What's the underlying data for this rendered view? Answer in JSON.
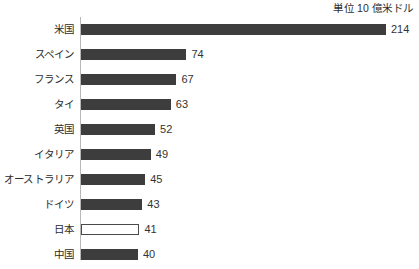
{
  "chart_data": {
    "type": "bar",
    "orientation": "horizontal",
    "title": "",
    "subtitle": "",
    "unit_caption": "単位 10 億米ドル",
    "xlabel": "",
    "ylabel": "",
    "grid": false,
    "legend": null,
    "xlim": [
      0,
      214
    ],
    "categories": [
      "米国",
      "スペイン",
      "フランス",
      "タイ",
      "英国",
      "イタリア",
      "オーストラリア",
      "ドイツ",
      "日本",
      "中国"
    ],
    "values": [
      214,
      74,
      67,
      63,
      52,
      49,
      45,
      43,
      41,
      40
    ],
    "bars": [
      {
        "label": "米国",
        "value": 214,
        "value_text": "214",
        "style": "filled"
      },
      {
        "label": "スペイン",
        "value": 74,
        "value_text": "74",
        "style": "filled"
      },
      {
        "label": "フランス",
        "value": 67,
        "value_text": "67",
        "style": "filled"
      },
      {
        "label": "タイ",
        "value": 63,
        "value_text": "63",
        "style": "filled"
      },
      {
        "label": "英国",
        "value": 52,
        "value_text": "52",
        "style": "filled"
      },
      {
        "label": "イタリア",
        "value": 49,
        "value_text": "49",
        "style": "filled"
      },
      {
        "label": "オーストラリア",
        "value": 45,
        "value_text": "45",
        "style": "filled"
      },
      {
        "label": "ドイツ",
        "value": 43,
        "value_text": "43",
        "style": "filled"
      },
      {
        "label": "日本",
        "value": 41,
        "value_text": "41",
        "style": "hollow"
      },
      {
        "label": "中国",
        "value": 40,
        "value_text": "40",
        "style": "filled"
      }
    ],
    "colors": {
      "bar_fill": "#3d3d3d",
      "bar_outline": "#4a4a4a",
      "hollow_fill": "#ffffff",
      "axis_line": "#b8b8b8",
      "text": "#2b2b2b",
      "background": "#ffffff"
    },
    "scale_px_per_unit": 1.425
  }
}
